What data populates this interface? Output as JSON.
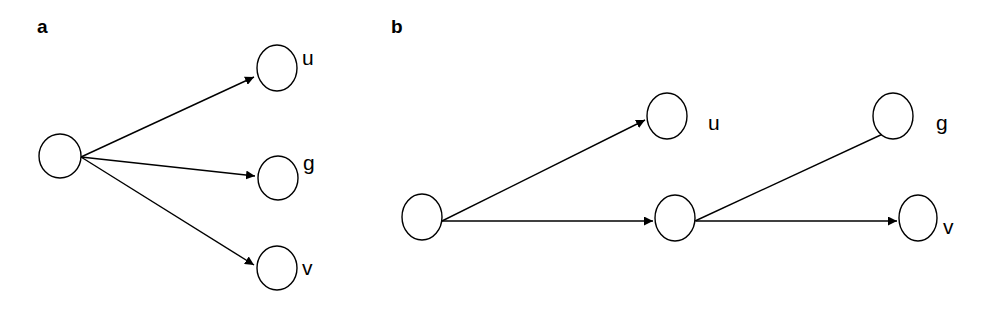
{
  "panels": [
    {
      "label": "a",
      "nodes": [
        {
          "id": "root",
          "label": ""
        },
        {
          "id": "u",
          "label": "u"
        },
        {
          "id": "g",
          "label": "g"
        },
        {
          "id": "v",
          "label": "v"
        }
      ],
      "edges": [
        [
          "root",
          "u"
        ],
        [
          "root",
          "g"
        ],
        [
          "root",
          "v"
        ]
      ]
    },
    {
      "label": "b",
      "nodes": [
        {
          "id": "root",
          "label": ""
        },
        {
          "id": "u",
          "label": "u"
        },
        {
          "id": "mid",
          "label": ""
        },
        {
          "id": "g",
          "label": "g"
        },
        {
          "id": "v",
          "label": "v"
        }
      ],
      "edges": [
        [
          "root",
          "u"
        ],
        [
          "root",
          "mid"
        ],
        [
          "mid",
          "g"
        ],
        [
          "mid",
          "v"
        ]
      ]
    }
  ],
  "colors": {
    "stroke": "#000000",
    "background": "#ffffff"
  }
}
